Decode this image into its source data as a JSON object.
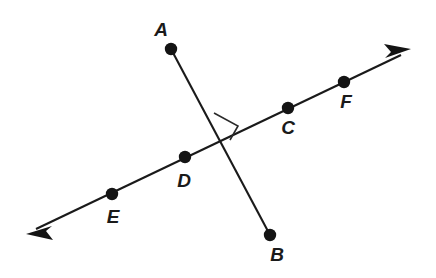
{
  "figure": {
    "background_color": "#ffffff",
    "stroke_color": "#1a1a1a",
    "label_color": "#1a1a1a",
    "width": 436,
    "height": 278
  },
  "labels": {
    "a": "A",
    "b": "B",
    "c": "C",
    "d": "D",
    "e": "E",
    "f": "F"
  },
  "geometry": {
    "segment_ab": {
      "name": "segment-AB",
      "from": [
        171,
        49
      ],
      "to": [
        270,
        235
      ],
      "endpoints_marked": true
    },
    "line_ef": {
      "name": "line-EF",
      "arrow_start": [
        27,
        233
      ],
      "arrow_end": [
        410,
        50
      ],
      "double_arrow": true
    },
    "intersection": [
      222,
      137
    ],
    "right_angle_marker": {
      "quadrant": "upper-right",
      "size": 17
    },
    "points": [
      {
        "id": "A",
        "x": 171,
        "y": 49,
        "label_x": 161,
        "label_y": 36
      },
      {
        "id": "B",
        "x": 270,
        "y": 235,
        "label_x": 277,
        "label_y": 261
      },
      {
        "id": "C",
        "x": 288,
        "y": 108,
        "label_x": 288,
        "label_y": 134
      },
      {
        "id": "D",
        "x": 185,
        "y": 157,
        "label_x": 184,
        "label_y": 187
      },
      {
        "id": "E",
        "x": 112,
        "y": 194,
        "label_x": 113,
        "label_y": 223
      },
      {
        "id": "F",
        "x": 344,
        "y": 82,
        "label_x": 346,
        "label_y": 108
      }
    ]
  }
}
